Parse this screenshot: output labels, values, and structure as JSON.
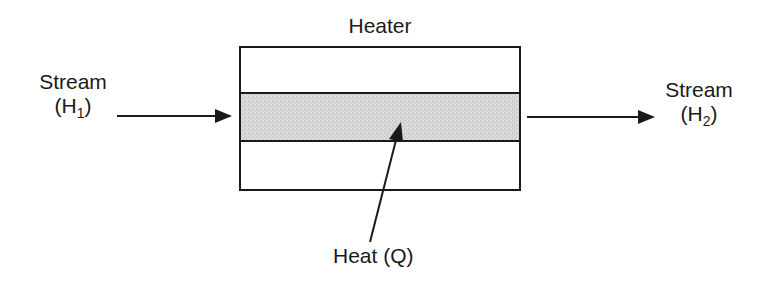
{
  "diagram": {
    "title": "Heater",
    "inlet": {
      "line1": "Stream",
      "open": "(H",
      "sub": "1",
      "close": ")"
    },
    "outlet": {
      "line1": "Stream",
      "open": "(H",
      "sub": "2",
      "close": ")"
    },
    "heat": {
      "label": "Heat (Q)"
    },
    "colors": {
      "line": "#1a1a1a",
      "band_fill": "#d4d4d4",
      "background": "#ffffff"
    }
  }
}
